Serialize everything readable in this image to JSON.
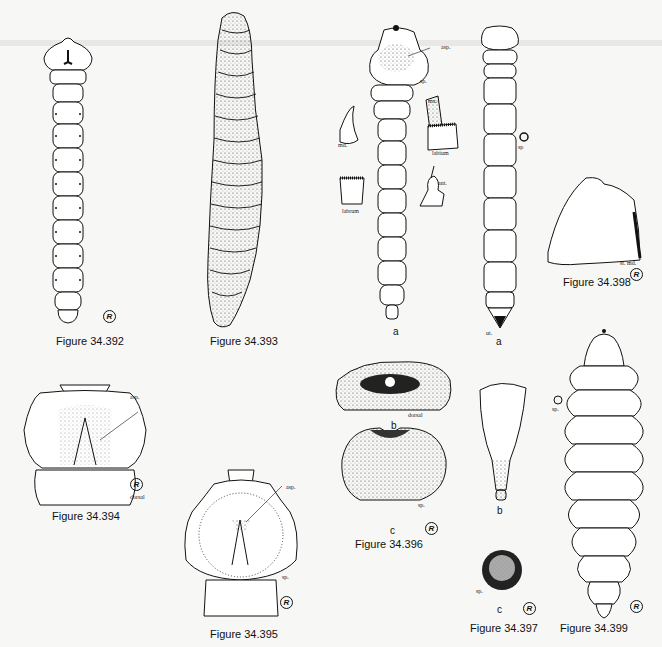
{
  "plate": {
    "figures": [
      {
        "id": "34.392",
        "caption": "Figure 34.392"
      },
      {
        "id": "34.393",
        "caption": "Figure 34.393"
      },
      {
        "id": "34.394",
        "caption": "Figure 34.394",
        "labels": {
          "asp": "asp.",
          "dorsal": "dorsal"
        }
      },
      {
        "id": "34.395",
        "caption": "Figure 34.395",
        "labels": {
          "asp": "asp.",
          "sp": "sp."
        }
      },
      {
        "id": "34.396",
        "caption": "Figure 34.396",
        "parts": [
          "a",
          "b",
          "c"
        ],
        "labels": {
          "asp": "asp.",
          "sp": "sp.",
          "md": "md.",
          "mx": "mx.",
          "labium": "labium",
          "labrum": "labrum",
          "ant": "ant.",
          "dorsal": "dorsal",
          "sp2": "sp."
        }
      },
      {
        "id": "34.397",
        "caption": "Figure 34.397",
        "parts": [
          "a",
          "b",
          "c"
        ],
        "labels": {
          "sp": "sp",
          "ut": "ut.",
          "sp2": "sp."
        }
      },
      {
        "id": "34.398",
        "caption": "Figure 34.398",
        "labels": {
          "stmd": "st. md."
        }
      },
      {
        "id": "34.399",
        "caption": "Figure 34.399",
        "labels": {
          "sp": "sp."
        }
      }
    ],
    "reg_mark": "R"
  }
}
